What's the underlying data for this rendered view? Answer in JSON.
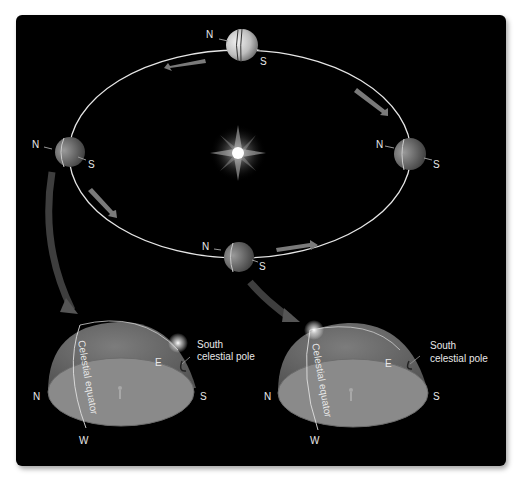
{
  "orbit": {
    "positions": [
      {
        "id": "top",
        "north": "N",
        "south": "S"
      },
      {
        "id": "left",
        "north": "N",
        "south": "S"
      },
      {
        "id": "right",
        "north": "N",
        "south": "S"
      },
      {
        "id": "bottom",
        "north": "N",
        "south": "S"
      }
    ]
  },
  "domes": [
    {
      "id": "left-dome",
      "equator_label": "Celestial equator",
      "pole_label_line1": "South",
      "pole_label_line2": "celestial pole",
      "dir_n": "N",
      "dir_s": "S",
      "dir_e": "E",
      "dir_w": "W"
    },
    {
      "id": "right-dome",
      "equator_label": "Celestial equator",
      "pole_label_line1": "South",
      "pole_label_line2": "celestial pole",
      "dir_n": "N",
      "dir_s": "S",
      "dir_e": "E",
      "dir_w": "W"
    }
  ],
  "colors": {
    "background": "#000000",
    "orbit": "#e6e6e6",
    "dome": "#7a7a7a",
    "ground": "#8c8c8c",
    "arrow": "#6e6e6e"
  }
}
